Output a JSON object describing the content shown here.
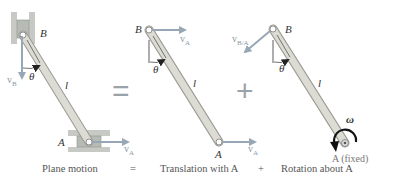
{
  "figure": {
    "panels": [
      {
        "name": "plane-motion",
        "point_B": "B",
        "point_A": "A",
        "velocity_B": "v",
        "velocity_B_sub": "B",
        "velocity_A": "v",
        "velocity_A_sub": "A",
        "angle": "θ",
        "length": "l",
        "caption": "Plane motion"
      },
      {
        "name": "translation",
        "point_B": "B",
        "point_A": "A",
        "velocity_B": "v",
        "velocity_B_sub": "A",
        "velocity_A": "v",
        "velocity_A_sub": "A",
        "angle": "θ",
        "length": "l",
        "caption": "Translation with A"
      },
      {
        "name": "rotation",
        "point_B": "B",
        "point_A": "A (fixed)",
        "velocity_B": "v",
        "velocity_B_sub": "B/A",
        "angular_velocity": "ω",
        "angle": "θ",
        "length": "l",
        "caption": "Rotation about A"
      }
    ],
    "operators": {
      "equals_big": "=",
      "plus_big": "+",
      "equals_caption": "=",
      "plus_caption": "+"
    }
  },
  "colors": {
    "link_fill": "#d9d9d2",
    "link_stroke": "#9a9a92",
    "arrow": "#97a7b5",
    "slider": "#c6c9c4",
    "text": "#333333"
  }
}
